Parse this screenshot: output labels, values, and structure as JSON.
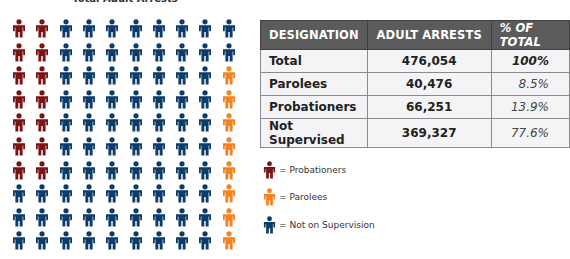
{
  "chart_data": {
    "type": "pictogram",
    "title": "Total Adult Arrests",
    "grid": {
      "rows": 10,
      "cols": 10,
      "unit_percent": 1
    },
    "colors": {
      "probationers": "#7a1414",
      "parolees": "#f58220",
      "not_supervised": "#0d3c6b"
    },
    "counts": {
      "probationers": 14,
      "parolees": 8,
      "not_supervised": 78
    },
    "layout_rule": "columns 1-2 rows 1-7 = probationers; column 10 rows 3-10 = parolees; rest = not supervised",
    "categories": [
      "Total",
      "Parolees",
      "Probationers",
      "Not Supervised"
    ],
    "values": [
      476054,
      40476,
      66251,
      369327
    ],
    "percent": [
      "100%",
      "8.5%",
      "13.9%",
      "77.6%"
    ],
    "legend": [
      {
        "key": "probationers",
        "label": "= Probationers"
      },
      {
        "key": "parolees",
        "label": "= Parolees"
      },
      {
        "key": "not_supervised",
        "label": "= Not on Supervision"
      }
    ]
  },
  "title": "Total Adult Arrests",
  "table": {
    "headers": [
      "DESIGNATION",
      "ADULT ARRESTS",
      "% OF TOTAL"
    ],
    "rows": [
      {
        "designation": "Total",
        "arrests": "476,054",
        "percent": "100%"
      },
      {
        "designation": "Parolees",
        "arrests": "40,476",
        "percent": "8.5%"
      },
      {
        "designation": "Probationers",
        "arrests": "66,251",
        "percent": "13.9%"
      },
      {
        "designation": "Not Supervised",
        "arrests": "369,327",
        "percent": "77.6%"
      }
    ]
  },
  "legend": {
    "items": [
      {
        "label": "= Probationers",
        "color": "#7a1414"
      },
      {
        "label": "= Parolees",
        "color": "#f58220"
      },
      {
        "label": "= Not on Supervision",
        "color": "#0d3c6b"
      }
    ]
  }
}
